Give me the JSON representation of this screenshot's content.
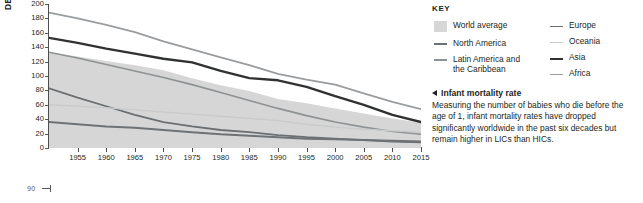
{
  "page": {
    "number": "90"
  },
  "key": {
    "title": "KEY",
    "columns": [
      [
        {
          "label": "World average",
          "indent": "",
          "type": "area",
          "color": "#d6d6d6"
        },
        {
          "label": "North America",
          "indent": "",
          "type": "line",
          "color": "#6e7275",
          "width": 2
        },
        {
          "label": "Latin America and",
          "indent": "the Caribbean",
          "type": "line",
          "color": "#8e9294",
          "width": 1.6
        }
      ],
      [
        {
          "label": "Europe",
          "indent": "",
          "type": "line",
          "color": "#6b6f72",
          "width": 1.8
        },
        {
          "label": "Oceania",
          "indent": "",
          "type": "line",
          "color": "#c8cacb",
          "width": 1.4
        },
        {
          "label": "Asia",
          "indent": "",
          "type": "line",
          "color": "#2f3133",
          "width": 2.4
        },
        {
          "label": "Africa",
          "indent": "",
          "type": "line",
          "color": "#9a9d9f",
          "width": 1.8
        }
      ]
    ]
  },
  "blurb": {
    "heading": "Infant mortality rate",
    "body": "Measuring the number of babies who die before the age of 1, infant mortality rates have dropped significantly worldwide in the past six decades but remain higher in LICs than HICs."
  },
  "chart_data": {
    "type": "line",
    "title": "Infant mortality rate",
    "xlabel": "",
    "ylabel": "DEATHS PER 1,000 BIRTHS",
    "ylim": [
      0,
      200
    ],
    "xlim": [
      1950,
      2015
    ],
    "yticks": [
      0,
      20,
      40,
      60,
      80,
      100,
      120,
      140,
      160,
      180,
      200
    ],
    "xticks": [
      1955,
      1960,
      1965,
      1970,
      1975,
      1980,
      1985,
      1990,
      1995,
      2000,
      2005,
      2010,
      2015
    ],
    "grid": false,
    "legend_position": "right",
    "x": [
      1950,
      1955,
      1960,
      1965,
      1970,
      1975,
      1980,
      1985,
      1990,
      1995,
      2000,
      2005,
      2010,
      2015
    ],
    "band": {
      "name": "World average",
      "color": "#d6d6d6",
      "upper": [
        133,
        127,
        121,
        115,
        108,
        97,
        87,
        79,
        68,
        62,
        55,
        48,
        41,
        35
      ],
      "lower": [
        0,
        0,
        0,
        0,
        0,
        0,
        0,
        0,
        0,
        0,
        0,
        0,
        0,
        0
      ]
    },
    "series": [
      {
        "name": "Africa",
        "color": "#9a9d9f",
        "width": 1.8,
        "values": [
          188,
          180,
          171,
          161,
          148,
          137,
          126,
          115,
          103,
          95,
          88,
          76,
          64,
          54
        ]
      },
      {
        "name": "Asia",
        "color": "#2f3133",
        "width": 2.4,
        "values": [
          153,
          146,
          138,
          131,
          124,
          119,
          107,
          97,
          94,
          85,
          72,
          60,
          46,
          36
        ]
      },
      {
        "name": "Latin America and the Caribbean",
        "color": "#8e9294",
        "width": 1.6,
        "values": [
          133,
          125,
          116,
          107,
          98,
          88,
          77,
          66,
          55,
          45,
          36,
          29,
          23,
          19
        ]
      },
      {
        "name": "Europe",
        "color": "#6b6f72",
        "width": 1.8,
        "values": [
          83,
          70,
          58,
          46,
          36,
          30,
          25,
          22,
          18,
          15,
          13,
          11,
          9,
          8
        ]
      },
      {
        "name": "Oceania",
        "color": "#c8cacb",
        "width": 1.4,
        "values": [
          60,
          58,
          56,
          53,
          50,
          47,
          44,
          41,
          38,
          33,
          29,
          26,
          24,
          22
        ]
      },
      {
        "name": "North America",
        "color": "#6e7275",
        "width": 2,
        "values": [
          36,
          33,
          30,
          28,
          25,
          22,
          19,
          17,
          15,
          13,
          12,
          11,
          10,
          9
        ]
      }
    ]
  }
}
